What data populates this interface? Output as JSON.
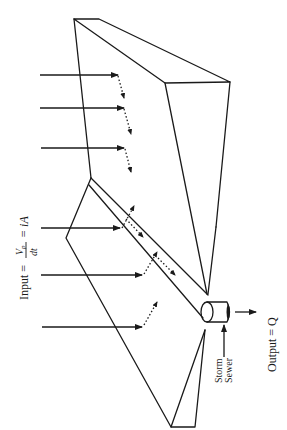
{
  "diagram": {
    "input_label": {
      "prefix": "Input = ",
      "fraction_num": "V",
      "fraction_num_sub": "p",
      "fraction_den": "dt",
      "suffix": "= iA"
    },
    "output_label": "Output = Q",
    "sewer_label_line1": "Storm",
    "sewer_label_line2": "Sewer",
    "colors": {
      "stroke": "#1a1a1a",
      "background": "#ffffff"
    },
    "rainfall_arrows": [
      {
        "y": 75,
        "x_start": 40,
        "x_end": 118
      },
      {
        "y": 108,
        "x_start": 40,
        "x_end": 124
      },
      {
        "y": 148,
        "x_start": 41,
        "x_end": 124
      },
      {
        "y": 228,
        "x_start": 41,
        "x_end": 120
      },
      {
        "y": 275,
        "x_start": 41,
        "x_end": 142
      },
      {
        "y": 327,
        "x_start": 42,
        "x_end": 142
      }
    ]
  }
}
